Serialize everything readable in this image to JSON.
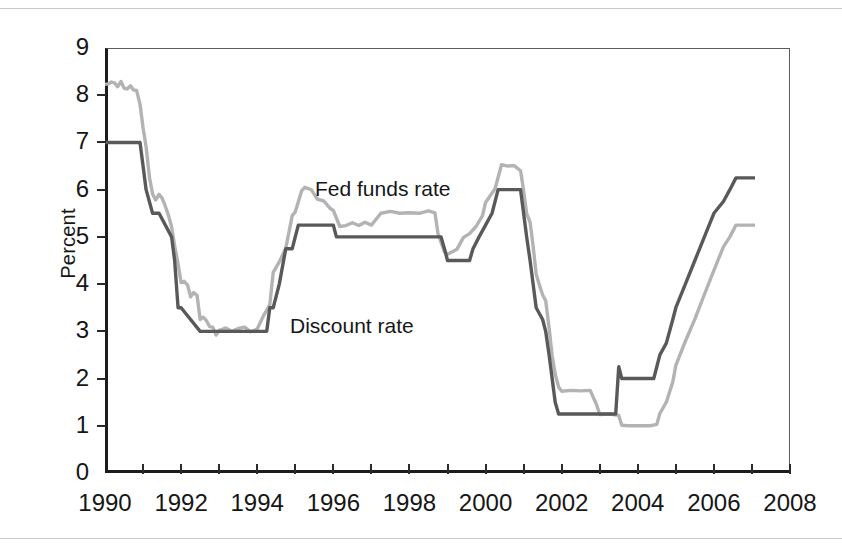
{
  "figure": {
    "ylabel": "Percent",
    "y_ticks": [
      "0",
      "1",
      "2",
      "3",
      "4",
      "5",
      "6",
      "7",
      "8",
      "9"
    ],
    "x_ticks": [
      "1990",
      "1992",
      "1994",
      "1996",
      "1998",
      "2000",
      "2002",
      "2004",
      "2006",
      "2008"
    ],
    "series_labels": {
      "fed": "Fed funds rate",
      "discount": "Discount rate"
    },
    "colors": {
      "fed_funds": "#b3b3b3",
      "discount": "#595959",
      "axis": "#1c1c1c",
      "frame": "#5c5c5c",
      "page_rule": "#c9c9cc",
      "background": "#ffffff"
    }
  },
  "chart_data": {
    "type": "line",
    "title": "",
    "xlabel": "",
    "ylabel": "Percent",
    "xlim": [
      1990,
      2008
    ],
    "ylim": [
      0,
      9
    ],
    "grid": false,
    "legend": "inline-annotations",
    "x_tick_values": [
      1990,
      1992,
      1994,
      1996,
      1998,
      2000,
      2002,
      2004,
      2006,
      2008
    ],
    "x_minor_tick_interval": 1,
    "y_tick_values": [
      0,
      1,
      2,
      3,
      4,
      5,
      6,
      7,
      8,
      9
    ],
    "series": [
      {
        "name": "Fed funds rate",
        "color": "#b3b3b3",
        "points": [
          [
            1990.0,
            8.23
          ],
          [
            1990.08,
            8.24
          ],
          [
            1990.17,
            8.28
          ],
          [
            1990.25,
            8.26
          ],
          [
            1990.33,
            8.18
          ],
          [
            1990.42,
            8.29
          ],
          [
            1990.5,
            8.15
          ],
          [
            1990.58,
            8.13
          ],
          [
            1990.67,
            8.2
          ],
          [
            1990.75,
            8.11
          ],
          [
            1990.83,
            8.1
          ],
          [
            1990.92,
            7.81
          ],
          [
            1991.0,
            7.31
          ],
          [
            1991.08,
            6.91
          ],
          [
            1991.17,
            6.25
          ],
          [
            1991.25,
            5.91
          ],
          [
            1991.33,
            5.78
          ],
          [
            1991.42,
            5.9
          ],
          [
            1991.5,
            5.82
          ],
          [
            1991.58,
            5.66
          ],
          [
            1991.67,
            5.45
          ],
          [
            1991.75,
            5.21
          ],
          [
            1991.83,
            4.81
          ],
          [
            1991.92,
            4.43
          ],
          [
            1992.0,
            4.03
          ],
          [
            1992.08,
            4.06
          ],
          [
            1992.17,
            3.98
          ],
          [
            1992.25,
            3.73
          ],
          [
            1992.33,
            3.82
          ],
          [
            1992.42,
            3.76
          ],
          [
            1992.5,
            3.25
          ],
          [
            1992.58,
            3.3
          ],
          [
            1992.67,
            3.22
          ],
          [
            1992.75,
            3.1
          ],
          [
            1992.83,
            3.09
          ],
          [
            1992.92,
            2.92
          ],
          [
            1993.0,
            3.02
          ],
          [
            1993.17,
            3.07
          ],
          [
            1993.33,
            3.0
          ],
          [
            1993.5,
            3.06
          ],
          [
            1993.67,
            3.09
          ],
          [
            1993.83,
            2.99
          ],
          [
            1994.0,
            3.05
          ],
          [
            1994.17,
            3.34
          ],
          [
            1994.33,
            3.56
          ],
          [
            1994.42,
            4.25
          ],
          [
            1994.58,
            4.47
          ],
          [
            1994.75,
            4.76
          ],
          [
            1994.92,
            5.45
          ],
          [
            1995.0,
            5.53
          ],
          [
            1995.17,
            5.98
          ],
          [
            1995.25,
            6.05
          ],
          [
            1995.42,
            6.0
          ],
          [
            1995.58,
            5.8
          ],
          [
            1995.75,
            5.76
          ],
          [
            1995.92,
            5.6
          ],
          [
            1996.0,
            5.56
          ],
          [
            1996.17,
            5.22
          ],
          [
            1996.33,
            5.24
          ],
          [
            1996.5,
            5.3
          ],
          [
            1996.67,
            5.24
          ],
          [
            1996.83,
            5.31
          ],
          [
            1997.0,
            5.25
          ],
          [
            1997.25,
            5.5
          ],
          [
            1997.5,
            5.54
          ],
          [
            1997.75,
            5.5
          ],
          [
            1998.0,
            5.51
          ],
          [
            1998.25,
            5.5
          ],
          [
            1998.5,
            5.55
          ],
          [
            1998.67,
            5.51
          ],
          [
            1998.75,
            5.07
          ],
          [
            1998.92,
            4.68
          ],
          [
            1999.0,
            4.63
          ],
          [
            1999.25,
            4.74
          ],
          [
            1999.42,
            4.99
          ],
          [
            1999.58,
            5.07
          ],
          [
            1999.75,
            5.22
          ],
          [
            1999.92,
            5.45
          ],
          [
            2000.0,
            5.73
          ],
          [
            2000.25,
            6.02
          ],
          [
            2000.42,
            6.53
          ],
          [
            2000.58,
            6.5
          ],
          [
            2000.75,
            6.51
          ],
          [
            2000.92,
            6.4
          ],
          [
            2001.0,
            5.98
          ],
          [
            2001.08,
            5.49
          ],
          [
            2001.17,
            5.31
          ],
          [
            2001.25,
            4.8
          ],
          [
            2001.33,
            4.21
          ],
          [
            2001.42,
            3.97
          ],
          [
            2001.5,
            3.77
          ],
          [
            2001.58,
            3.65
          ],
          [
            2001.67,
            3.07
          ],
          [
            2001.75,
            2.49
          ],
          [
            2001.83,
            2.09
          ],
          [
            2001.92,
            1.82
          ],
          [
            2002.0,
            1.73
          ],
          [
            2002.25,
            1.75
          ],
          [
            2002.5,
            1.74
          ],
          [
            2002.75,
            1.75
          ],
          [
            2002.92,
            1.44
          ],
          [
            2003.0,
            1.24
          ],
          [
            2003.25,
            1.25
          ],
          [
            2003.5,
            1.22
          ],
          [
            2003.58,
            1.01
          ],
          [
            2003.75,
            1.0
          ],
          [
            2004.0,
            1.0
          ],
          [
            2004.33,
            1.0
          ],
          [
            2004.5,
            1.03
          ],
          [
            2004.58,
            1.26
          ],
          [
            2004.75,
            1.5
          ],
          [
            2004.92,
            1.93
          ],
          [
            2005.0,
            2.28
          ],
          [
            2005.25,
            2.79
          ],
          [
            2005.5,
            3.26
          ],
          [
            2005.75,
            3.78
          ],
          [
            2006.0,
            4.29
          ],
          [
            2006.25,
            4.79
          ],
          [
            2006.42,
            5.0
          ],
          [
            2006.58,
            5.25
          ],
          [
            2006.75,
            5.25
          ],
          [
            2007.0,
            5.25
          ],
          [
            2007.08,
            5.25
          ]
        ]
      },
      {
        "name": "Discount rate",
        "color": "#595959",
        "points": [
          [
            1990.0,
            7.0
          ],
          [
            1990.92,
            7.0
          ],
          [
            1991.0,
            6.5
          ],
          [
            1991.08,
            6.0
          ],
          [
            1991.25,
            5.5
          ],
          [
            1991.33,
            5.5
          ],
          [
            1991.42,
            5.5
          ],
          [
            1991.75,
            5.0
          ],
          [
            1991.83,
            4.5
          ],
          [
            1991.92,
            3.5
          ],
          [
            1992.0,
            3.5
          ],
          [
            1992.5,
            3.0
          ],
          [
            1994.25,
            3.0
          ],
          [
            1994.33,
            3.5
          ],
          [
            1994.42,
            3.5
          ],
          [
            1994.58,
            4.0
          ],
          [
            1994.75,
            4.75
          ],
          [
            1994.92,
            4.75
          ],
          [
            1995.08,
            5.25
          ],
          [
            1996.0,
            5.25
          ],
          [
            1996.08,
            5.0
          ],
          [
            1998.83,
            5.0
          ],
          [
            1998.92,
            4.75
          ],
          [
            1999.0,
            4.5
          ],
          [
            1999.58,
            4.5
          ],
          [
            1999.67,
            4.75
          ],
          [
            1999.83,
            5.0
          ],
          [
            2000.0,
            5.25
          ],
          [
            2000.17,
            5.5
          ],
          [
            2000.33,
            6.0
          ],
          [
            2000.92,
            6.0
          ],
          [
            2001.0,
            5.5
          ],
          [
            2001.08,
            5.0
          ],
          [
            2001.17,
            4.5
          ],
          [
            2001.25,
            4.0
          ],
          [
            2001.33,
            3.5
          ],
          [
            2001.5,
            3.25
          ],
          [
            2001.58,
            3.0
          ],
          [
            2001.67,
            2.5
          ],
          [
            2001.75,
            2.0
          ],
          [
            2001.83,
            1.5
          ],
          [
            2001.92,
            1.25
          ],
          [
            2002.0,
            1.25
          ],
          [
            2003.0,
            1.25
          ],
          [
            2003.08,
            1.25
          ],
          [
            2003.42,
            1.25
          ],
          [
            2003.5,
            2.25
          ],
          [
            2003.58,
            2.0
          ],
          [
            2003.67,
            2.0
          ],
          [
            2004.0,
            2.0
          ],
          [
            2004.42,
            2.0
          ],
          [
            2004.5,
            2.25
          ],
          [
            2004.58,
            2.5
          ],
          [
            2004.75,
            2.75
          ],
          [
            2004.92,
            3.25
          ],
          [
            2005.0,
            3.5
          ],
          [
            2005.25,
            4.0
          ],
          [
            2005.5,
            4.5
          ],
          [
            2005.75,
            5.0
          ],
          [
            2006.0,
            5.5
          ],
          [
            2006.25,
            5.75
          ],
          [
            2006.42,
            6.0
          ],
          [
            2006.58,
            6.25
          ],
          [
            2006.75,
            6.25
          ],
          [
            2007.0,
            6.25
          ],
          [
            2007.08,
            6.25
          ]
        ]
      }
    ],
    "annotations": [
      {
        "text": "Fed funds rate",
        "x": 1995.5,
        "y": 6.45
      },
      {
        "text": "Discount rate",
        "x": 1995.0,
        "y": 3.6
      }
    ]
  }
}
